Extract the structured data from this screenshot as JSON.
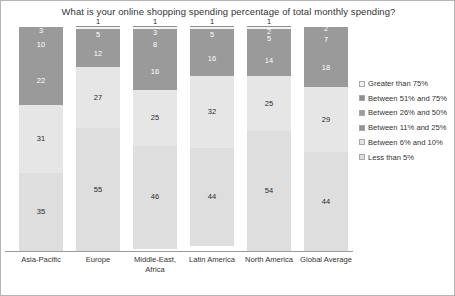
{
  "chart_data": {
    "type": "bar",
    "title": "What is your online shopping spending percentage of total monthly spending?",
    "xlabel": "",
    "ylabel": "",
    "ylim": [
      0,
      100
    ],
    "grid": false,
    "legend_position": "right",
    "stacked": true,
    "categories": [
      "Asia-Pacific",
      "Europe",
      "Middle-East, Africa",
      "Latin America",
      "North America",
      "Global Average"
    ],
    "series": [
      {
        "name": "Greater than 75%",
        "color": "#ededed",
        "values": [
          0,
          1,
          1,
          1,
          1,
          2
        ]
      },
      {
        "name": "Between 51% and 75%",
        "color": "#8f8f8f",
        "values": [
          3,
          0,
          3,
          0,
          2,
          0
        ]
      },
      {
        "name": "Between 26% and 50%",
        "color": "#9b9b9b",
        "values": [
          10,
          5,
          8,
          5,
          5,
          7
        ]
      },
      {
        "name": "Between 11% and 25%",
        "color": "#949494",
        "values": [
          22,
          12,
          16,
          16,
          14,
          18
        ]
      },
      {
        "name": "Between 6% and 10%",
        "color": "#e4e4e4",
        "values": [
          31,
          27,
          25,
          32,
          25,
          29
        ]
      },
      {
        "name": "Less than 5%",
        "color": "#dedede",
        "values": [
          35,
          55,
          46,
          44,
          54,
          44
        ]
      }
    ]
  },
  "legend": {
    "items": [
      {
        "label": "Greater than 75%",
        "swatch": "#f2f2f2"
      },
      {
        "label": "Between 51% and 75%",
        "swatch": "#8f8f8f"
      },
      {
        "label": "Between 26% and 50%",
        "swatch": "#9b9b9b"
      },
      {
        "label": "Between 11% and 25%",
        "swatch": "#949494"
      },
      {
        "label": "Between 6% and 10%",
        "swatch": "#e4e4e4"
      },
      {
        "label": "Less than 5%",
        "swatch": "#dedede"
      }
    ]
  },
  "bars": [
    {
      "category": "Asia-Pacific",
      "segments": [
        {
          "value": "3",
          "raw": 3,
          "color": "#9a9a9a",
          "text": "light",
          "outside": false,
          "tick": false
        },
        {
          "value": "10",
          "raw": 10,
          "color": "#9a9a9a",
          "text": "light",
          "outside": false,
          "tick": false
        },
        {
          "value": "22",
          "raw": 22,
          "color": "#9a9a9a",
          "text": "light",
          "outside": false,
          "tick": false
        },
        {
          "value": "31",
          "raw": 31,
          "color": "#e6e6e6",
          "text": "dark",
          "outside": false,
          "tick": false
        },
        {
          "value": "35",
          "raw": 35,
          "color": "#dedede",
          "text": "dark",
          "outside": false,
          "tick": false
        }
      ]
    },
    {
      "category": "Europe",
      "segments": [
        {
          "value": "1",
          "raw": 1,
          "color": "#f4f4f4",
          "text": "dark",
          "outside": true,
          "tick": true
        },
        {
          "value": "5",
          "raw": 5,
          "color": "#9a9a9a",
          "text": "light",
          "outside": false,
          "tick": false
        },
        {
          "value": "12",
          "raw": 12,
          "color": "#9a9a9a",
          "text": "light",
          "outside": false,
          "tick": false
        },
        {
          "value": "27",
          "raw": 27,
          "color": "#e6e6e6",
          "text": "dark",
          "outside": false,
          "tick": false
        },
        {
          "value": "55",
          "raw": 55,
          "color": "#dedede",
          "text": "dark",
          "outside": false,
          "tick": false
        }
      ]
    },
    {
      "category": "Middle-East, Africa",
      "segments": [
        {
          "value": "1",
          "raw": 1,
          "color": "#f4f4f4",
          "text": "dark",
          "outside": true,
          "tick": true
        },
        {
          "value": "3",
          "raw": 3,
          "color": "#9a9a9a",
          "text": "light",
          "outside": false,
          "tick": false
        },
        {
          "value": "8",
          "raw": 8,
          "color": "#9a9a9a",
          "text": "light",
          "outside": false,
          "tick": false
        },
        {
          "value": "16",
          "raw": 16,
          "color": "#9a9a9a",
          "text": "light",
          "outside": false,
          "tick": false
        },
        {
          "value": "25",
          "raw": 25,
          "color": "#e6e6e6",
          "text": "dark",
          "outside": false,
          "tick": false
        },
        {
          "value": "46",
          "raw": 46,
          "color": "#dedede",
          "text": "dark",
          "outside": false,
          "tick": false
        }
      ]
    },
    {
      "category": "Latin America",
      "segments": [
        {
          "value": "1",
          "raw": 1,
          "color": "#f4f4f4",
          "text": "dark",
          "outside": true,
          "tick": true
        },
        {
          "value": "5",
          "raw": 5,
          "color": "#9a9a9a",
          "text": "light",
          "outside": false,
          "tick": false
        },
        {
          "value": "16",
          "raw": 16,
          "color": "#9a9a9a",
          "text": "light",
          "outside": false,
          "tick": false
        },
        {
          "value": "32",
          "raw": 32,
          "color": "#e6e6e6",
          "text": "dark",
          "outside": false,
          "tick": false
        },
        {
          "value": "44",
          "raw": 44,
          "color": "#dedede",
          "text": "dark",
          "outside": false,
          "tick": false
        }
      ]
    },
    {
      "category": "North America",
      "segments": [
        {
          "value": "1",
          "raw": 1,
          "color": "#f4f4f4",
          "text": "dark",
          "outside": true,
          "tick": true
        },
        {
          "value": "2",
          "raw": 2,
          "color": "#9a9a9a",
          "text": "light",
          "outside": false,
          "tick": false
        },
        {
          "value": "5",
          "raw": 5,
          "color": "#9a9a9a",
          "text": "light",
          "outside": false,
          "tick": false
        },
        {
          "value": "14",
          "raw": 14,
          "color": "#9a9a9a",
          "text": "light",
          "outside": false,
          "tick": false
        },
        {
          "value": "25",
          "raw": 25,
          "color": "#e6e6e6",
          "text": "dark",
          "outside": false,
          "tick": false
        },
        {
          "value": "54",
          "raw": 54,
          "color": "#dedede",
          "text": "dark",
          "outside": false,
          "tick": false
        }
      ]
    },
    {
      "category": "Global Average",
      "segments": [
        {
          "value": "2",
          "raw": 2,
          "color": "#9a9a9a",
          "text": "light",
          "outside": false,
          "tick": false
        },
        {
          "value": "7",
          "raw": 7,
          "color": "#9a9a9a",
          "text": "light",
          "outside": false,
          "tick": false
        },
        {
          "value": "18",
          "raw": 18,
          "color": "#9a9a9a",
          "text": "light",
          "outside": false,
          "tick": false
        },
        {
          "value": "29",
          "raw": 29,
          "color": "#e6e6e6",
          "text": "dark",
          "outside": false,
          "tick": false
        },
        {
          "value": "44",
          "raw": 44,
          "color": "#dedede",
          "text": "dark",
          "outside": false,
          "tick": false
        }
      ]
    }
  ]
}
